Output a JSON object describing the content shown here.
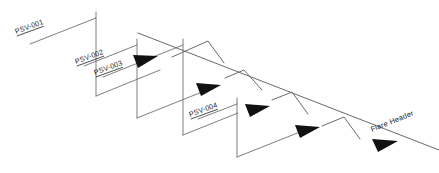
{
  "diagram": {
    "type": "piping-isometric",
    "background_color": "#ffffff",
    "line_color": "#6f6f6f",
    "arrow_color": "#111111",
    "text_color": "#1a1a1a",
    "labels": {
      "psv_001": "PSV-001",
      "psv_002": "PSV-002",
      "psv_003": "PSV-003",
      "psv_004": "PSV-004",
      "flare_header": "Flare Header"
    },
    "label_list": [
      {
        "id": "psv-001",
        "text": "PSV-001",
        "x": 16,
        "y": 34,
        "rotation": -20
      },
      {
        "id": "psv-002",
        "text": "PSV-002",
        "x": 76,
        "y": 64,
        "rotation": -20
      },
      {
        "id": "psv-003",
        "text": "PSV-003",
        "x": 95,
        "y": 75,
        "rotation": -20
      },
      {
        "id": "psv-004",
        "text": "PSV-004",
        "x": 190,
        "y": 117,
        "rotation": -20
      },
      {
        "id": "flare-header",
        "text": "Flare Header",
        "x": 372,
        "y": 132,
        "rotation": -22
      }
    ],
    "flow_arrows": [
      {
        "id": "flow-arrow-1",
        "x": 144,
        "y": 61
      },
      {
        "id": "flow-arrow-2",
        "x": 206,
        "y": 89
      },
      {
        "id": "flow-arrow-3",
        "x": 255,
        "y": 110
      },
      {
        "id": "flow-arrow-4",
        "x": 305,
        "y": 131
      },
      {
        "id": "flow-arrow-5",
        "x": 383,
        "y": 145
      }
    ],
    "branch_count": 4,
    "peak_count": 4
  }
}
